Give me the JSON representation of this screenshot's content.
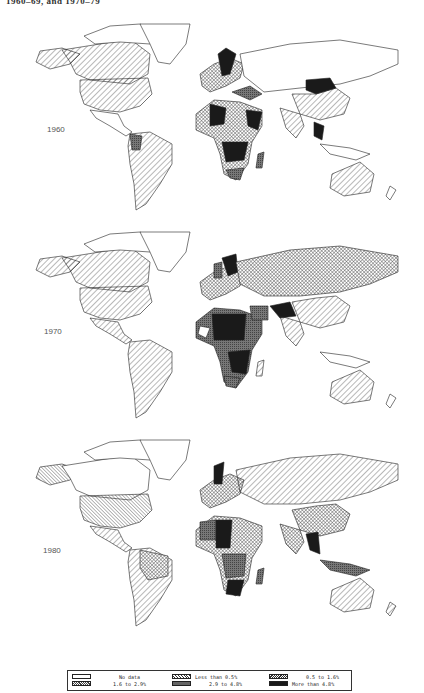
{
  "caption": "1960–69, and 1970–79",
  "maps": [
    {
      "year": "1960"
    },
    {
      "year": "1970"
    },
    {
      "year": "1980"
    }
  ],
  "legend": {
    "items": [
      {
        "label": "No data",
        "pattern": "blank"
      },
      {
        "label": "Less than 0.5%",
        "pattern": "diag-wide"
      },
      {
        "label": "0.5 to 1.6%",
        "pattern": "diag-fine"
      },
      {
        "label": "1.6 to 2.9%",
        "pattern": "crosshatch"
      },
      {
        "label": "2.9 to 4.8%",
        "pattern": "dense-gray"
      },
      {
        "label": "More than 4.8%",
        "pattern": "solid-black"
      }
    ]
  },
  "colors": {
    "outline": "#222222",
    "gray": "#6e6e6e",
    "black": "#1a1a1a"
  }
}
